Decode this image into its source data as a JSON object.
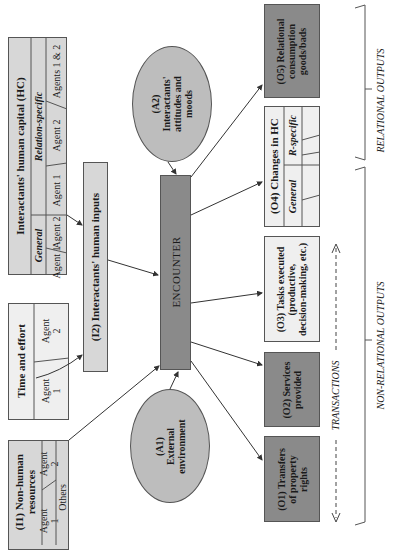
{
  "diagram": {
    "orientation": "rotated 90deg counter-clockwise",
    "human_capital": {
      "title": "Interactants' human capital (HC)",
      "general_label": "General",
      "relation_specific_label": "Relation-specific",
      "cells": [
        "Agent 1",
        "Agent 2",
        "Agent 1",
        "Agent 2",
        "Agents 1 & 2"
      ]
    },
    "human_inputs": {
      "label": "(I2) Interactants' human inputs"
    },
    "time_effort": {
      "title": "Time and effort",
      "cells": [
        "Agent\n1",
        "Agent\n2"
      ]
    },
    "non_human": {
      "title": "(I1) Non-human\nresources",
      "cells": [
        "Agent\n1",
        "Agent\n2",
        "Others"
      ]
    },
    "a2": {
      "label": "(A2)\nInteractants'\nattitudes and\nmoods"
    },
    "a1": {
      "label": "(A1)\nExternal\nenvironment"
    },
    "encounter": {
      "label": "ENCOUNTER"
    },
    "outputs": [
      {
        "id": "O5",
        "label": "(O5) Relational\nconsumption\ngoods/bads",
        "shade": "dark"
      },
      {
        "id": "O4",
        "label": "(O4) Changes in HC",
        "general": "General",
        "r_specific": "R-specific",
        "shade": "white"
      },
      {
        "id": "O3",
        "label": "(O3) Tasks executed\n(productive,\ndecision-making, etc.)",
        "shade": "white"
      },
      {
        "id": "O2",
        "label": "(O2) Services\nprovided",
        "shade": "dark"
      },
      {
        "id": "O1",
        "label": "(O1) Transfers\nof property\nrights",
        "shade": "dark"
      }
    ],
    "transactions_label": "TRANSACTIONS",
    "relational_outputs_label": "RELATIONAL OUTPUTS",
    "non_relational_outputs_label": "NON-RELATIONAL OUTPUTS",
    "colors": {
      "light_fill": "#d7d7d7",
      "white_fill": "#efefef",
      "mid_fill": "#bdbdbd",
      "dark_fill": "#8a8a8a",
      "line": "#555555"
    }
  }
}
